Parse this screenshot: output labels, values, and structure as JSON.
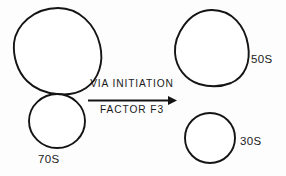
{
  "figure": {
    "background_color": "#fdfdfd",
    "line_color": "#141414",
    "text_color": "#1a1a1a"
  },
  "reactant": {
    "label": "70S",
    "description": "70S ribosome drawn as a large upper subunit shape touching a smaller lower circle"
  },
  "products": {
    "large_subunit": {
      "label": "50S"
    },
    "small_subunit": {
      "label": "30S"
    }
  },
  "reaction": {
    "text_above": "VIA INITIATION",
    "text_below": "FACTOR F3",
    "arrow_direction": "right"
  },
  "icons": {
    "arrow": "right-arrow-icon",
    "large_subunit_shape": "ellipse-outline-icon",
    "small_subunit_shape": "circle-outline-icon"
  }
}
